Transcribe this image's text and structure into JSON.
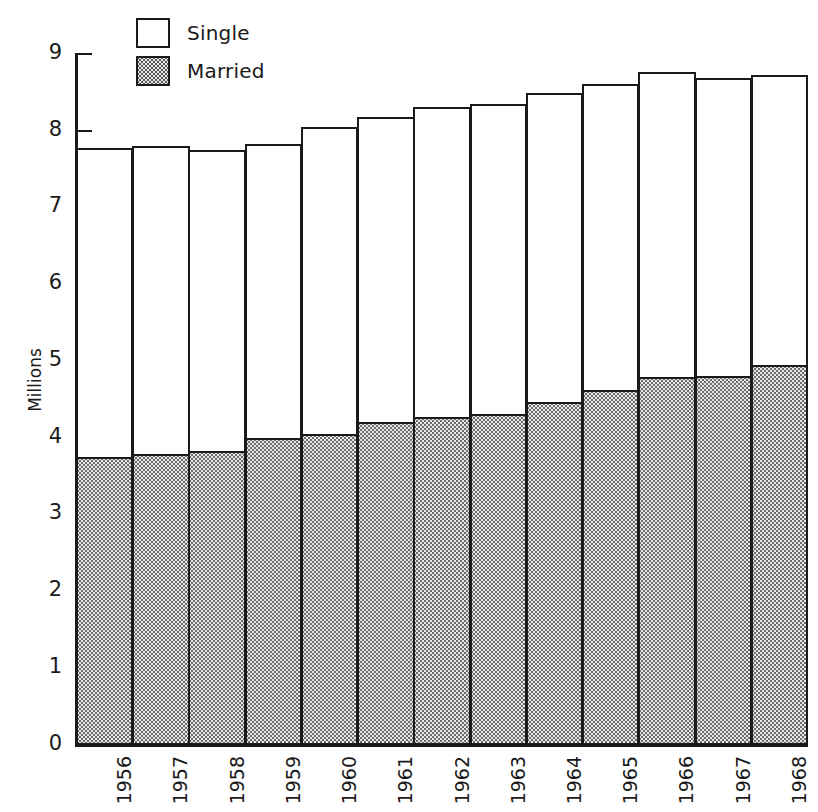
{
  "figure": {
    "y_axis_title": "Millions",
    "legend": [
      {
        "key": "single",
        "label": "Single",
        "swatch": "white-box"
      },
      {
        "key": "married",
        "label": "Married",
        "swatch": "stippled-box"
      }
    ]
  },
  "chart_data": {
    "type": "bar",
    "stacked": true,
    "title": "",
    "subtitle": "",
    "xlabel": "",
    "ylabel": "Millions",
    "ylim": [
      0,
      9
    ],
    "ytick_labels": [
      "0",
      "1",
      "2",
      "3",
      "4",
      "5",
      "6",
      "7",
      "8",
      "9"
    ],
    "yticks": [
      0,
      1,
      2,
      3,
      4,
      5,
      6,
      7,
      8,
      9
    ],
    "grid": false,
    "legend_position": "top-left",
    "categories": [
      "1956",
      "1957",
      "1958",
      "1959",
      "1960",
      "1961",
      "1962",
      "1963",
      "1964",
      "1965",
      "1966",
      "1967",
      "1968"
    ],
    "series": [
      {
        "name": "Married",
        "color": "#e6e6e6",
        "pattern": "stipple",
        "values": [
          3.76,
          3.79,
          3.83,
          4.0,
          4.06,
          4.21,
          4.28,
          4.31,
          4.47,
          4.63,
          4.8,
          4.81,
          4.95
        ]
      },
      {
        "name": "Single",
        "color": "#ffffff",
        "pattern": "none",
        "values": [
          4.02,
          4.02,
          3.93,
          3.84,
          3.99,
          3.98,
          4.03,
          4.05,
          4.03,
          3.98,
          3.97,
          3.89,
          3.78
        ]
      }
    ],
    "totals": [
      7.78,
      7.81,
      7.76,
      7.84,
      8.05,
      8.19,
      8.31,
      8.36,
      8.5,
      8.61,
      8.77,
      8.7,
      8.73
    ]
  }
}
